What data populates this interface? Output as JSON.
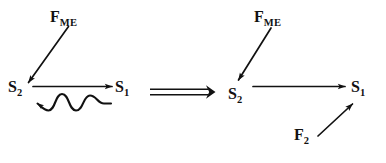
{
  "figure": {
    "background_color": "#ffffff",
    "stroke_color": "#111111",
    "width": 386,
    "height": 163
  },
  "left_panel": {
    "name": "before-scheme",
    "labels": {
      "force_me": {
        "base": "F",
        "sub": "ME"
      },
      "state_s2": {
        "base": "S",
        "sub": "2"
      },
      "state_s1": {
        "base": "S",
        "sub": "1"
      }
    },
    "arrows": [
      {
        "name": "fme-to-s2-arrow",
        "kind": "straight",
        "from": "F_ME",
        "to": "S_2",
        "direction": "down-left"
      },
      {
        "name": "s2-to-s1-arrow",
        "kind": "straight",
        "from": "S_2",
        "to": "S_1",
        "direction": "right"
      },
      {
        "name": "s1-to-s2-wavy-arrow",
        "kind": "wavy",
        "from": "S_1",
        "to": "S_2",
        "direction": "left"
      }
    ]
  },
  "implication": {
    "name": "implies-symbol",
    "glyph": "⟹",
    "meaning": "transforms into"
  },
  "right_panel": {
    "name": "after-scheme",
    "labels": {
      "force_me": {
        "base": "F",
        "sub": "ME"
      },
      "state_s2": {
        "base": "S",
        "sub": "2"
      },
      "state_s1": {
        "base": "S",
        "sub": "1"
      },
      "force_f2": {
        "base": "F",
        "sub": "2"
      }
    },
    "arrows": [
      {
        "name": "fme-to-s2-arrow",
        "kind": "straight",
        "from": "F_ME",
        "to": "S_2",
        "direction": "down-left"
      },
      {
        "name": "s2-to-s1-arrow",
        "kind": "straight",
        "from": "S_2",
        "to": "S_1",
        "direction": "right"
      },
      {
        "name": "f2-to-s1-arrow",
        "kind": "straight",
        "from": "F_2",
        "to": "S_1",
        "direction": "up-right"
      }
    ]
  }
}
